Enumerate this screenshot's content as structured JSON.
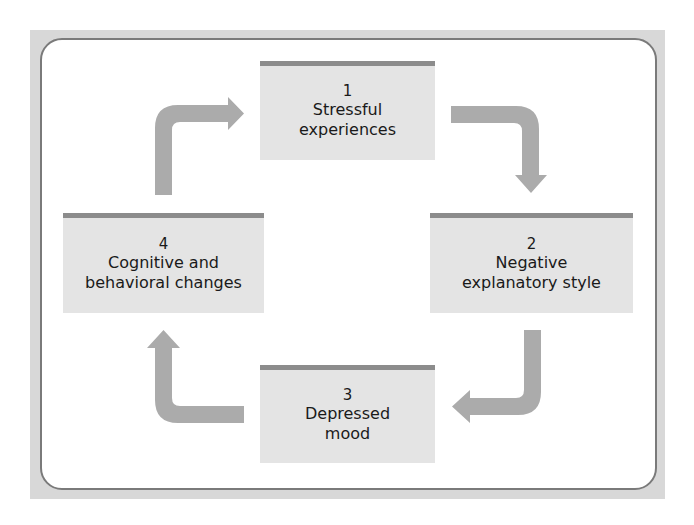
{
  "diagram": {
    "type": "cycle",
    "colors": {
      "frame": "#d8d8d8",
      "panel_border": "#7a7a7a",
      "box_fill": "#e4e4e4",
      "box_top_bar": "#8c8c8c",
      "arrow": "#ababab"
    },
    "nodes": [
      {
        "number": "1",
        "line1": "Stressful",
        "line2": "experiences"
      },
      {
        "number": "2",
        "line1": "Negative",
        "line2": "explanatory style"
      },
      {
        "number": "3",
        "line1": "Depressed",
        "line2": "mood"
      },
      {
        "number": "4",
        "line1": "Cognitive and",
        "line2": "behavioral changes"
      }
    ],
    "edges": [
      {
        "from": "1",
        "to": "2"
      },
      {
        "from": "2",
        "to": "3"
      },
      {
        "from": "3",
        "to": "4"
      },
      {
        "from": "4",
        "to": "1"
      }
    ]
  }
}
